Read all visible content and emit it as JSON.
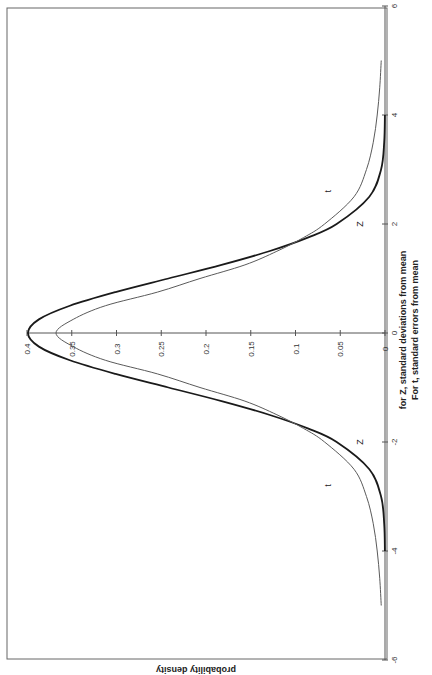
{
  "chart_data": {
    "type": "line",
    "orientation": "rotated-90-clockwise",
    "title": "",
    "xlabel_line1": "for Z, standard deviations from mean",
    "xlabel_line2": "For t, standard errors from mean",
    "ylabel": "probability density",
    "xlim": [
      -6,
      6
    ],
    "ylim": [
      0,
      0.4
    ],
    "x_ticks": [
      "-6",
      "-4",
      "-2",
      "0",
      "2",
      "4",
      "6"
    ],
    "y_ticks": [
      "0",
      "0.05",
      "0.1",
      "0.15",
      "0.2",
      "0.25",
      "0.3",
      "0.35",
      "0.4"
    ],
    "grid": false,
    "legend": "inline labels",
    "series": [
      {
        "name": "Z",
        "style": "thick dark line",
        "x": [
          -4,
          -3.5,
          -3,
          -2.5,
          -2,
          -1.75,
          -1.5,
          -1.25,
          -1,
          -0.75,
          -0.5,
          -0.25,
          0,
          0.25,
          0.5,
          0.75,
          1,
          1.25,
          1.5,
          1.75,
          2,
          2.5,
          3,
          3.5,
          4
        ],
        "values": [
          0.0001,
          0.0009,
          0.0044,
          0.0175,
          0.054,
          0.0863,
          0.1295,
          0.1826,
          0.242,
          0.3011,
          0.3521,
          0.3867,
          0.3989,
          0.3867,
          0.3521,
          0.3011,
          0.242,
          0.1826,
          0.1295,
          0.0863,
          0.054,
          0.0175,
          0.0044,
          0.0009,
          0.0001
        ]
      },
      {
        "name": "t",
        "style": "thin gray line",
        "x": [
          -5,
          -4.5,
          -4,
          -3.5,
          -3,
          -2.5,
          -2,
          -1.75,
          -1.5,
          -1.25,
          -1,
          -0.75,
          -0.5,
          -0.25,
          0,
          0.25,
          0.5,
          0.75,
          1,
          1.25,
          1.5,
          1.75,
          2,
          2.5,
          3,
          3.5,
          4,
          4.5,
          5
        ],
        "values": [
          0.0042,
          0.0059,
          0.0087,
          0.0131,
          0.0207,
          0.0346,
          0.0675,
          0.0911,
          0.1208,
          0.1565,
          0.2067,
          0.2543,
          0.3125,
          0.3484,
          0.3676,
          0.3484,
          0.3125,
          0.2543,
          0.2067,
          0.1565,
          0.1208,
          0.0911,
          0.0675,
          0.0346,
          0.0207,
          0.0131,
          0.0087,
          0.0059,
          0.0042
        ]
      }
    ],
    "annotations": [
      {
        "text": "t",
        "x": 2.6,
        "y": 0.06
      },
      {
        "text": "Z",
        "x": 2.0,
        "y": 0.025
      },
      {
        "text": "t",
        "x": -2.8,
        "y": 0.06
      },
      {
        "text": "Z",
        "x": -2.0,
        "y": 0.025
      }
    ]
  },
  "layout": {
    "axis_color": "#555555",
    "z_color": "#1a1a1a",
    "t_color": "#5a5a5a",
    "frame_color": "#666666"
  }
}
